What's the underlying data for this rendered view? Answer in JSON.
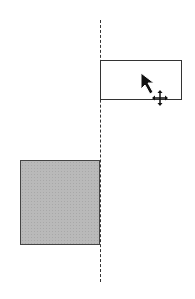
{
  "canvas": {
    "guide_line": {
      "style": "dashed",
      "orientation": "vertical",
      "color": "#333333"
    },
    "outline_box": {
      "fill": "#ffffff",
      "stroke": "#333333"
    },
    "filled_box": {
      "fill": "#b9b9b9",
      "stroke": "#444444"
    },
    "cursor": {
      "icons": [
        "arrow-pointer-icon",
        "move-icon"
      ]
    }
  }
}
